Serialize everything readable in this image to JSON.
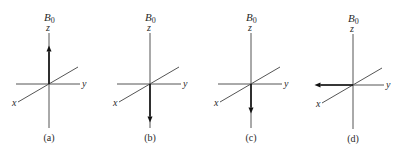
{
  "figure": {
    "field_label": "B",
    "field_subscript": "0",
    "axes": {
      "x": "x",
      "y": "y",
      "z": "z"
    },
    "panels": [
      {
        "caption": "(a)",
        "vector_direction": "+z",
        "vector_length": 0.55
      },
      {
        "caption": "(b)",
        "vector_direction": "-z",
        "vector_length": 0.55
      },
      {
        "caption": "(c)",
        "vector_direction": "-z",
        "vector_length": 0.42
      },
      {
        "caption": "(d)",
        "vector_direction": "-y",
        "vector_length": 0.55
      }
    ]
  }
}
